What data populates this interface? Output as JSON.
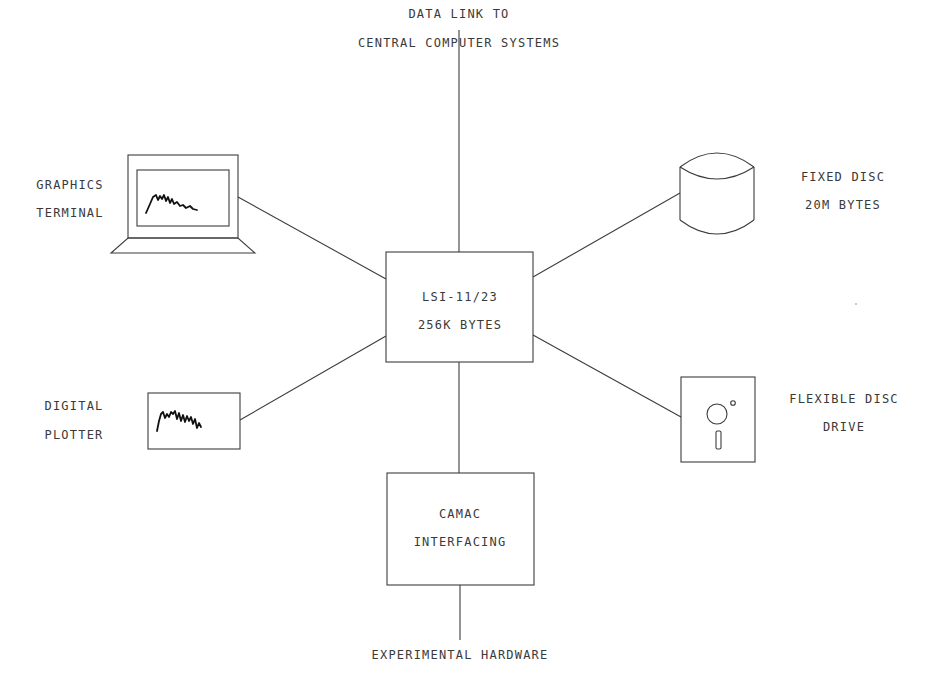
{
  "diagram": {
    "type": "system-block-diagram",
    "center": {
      "line1": "LSI-11/23",
      "line2": "256K BYTES"
    },
    "top_link": {
      "line1": "DATA LINK TO",
      "line2": "CENTRAL COMPUTER SYSTEMS"
    },
    "graphics_terminal": {
      "line1": "GRAPHICS",
      "line2": "TERMINAL",
      "icon": "terminal-icon"
    },
    "fixed_disc": {
      "line1": "FIXED DISC",
      "line2": "20M BYTES",
      "icon": "disc-cylinder-icon"
    },
    "digital_plotter": {
      "line1": "DIGITAL",
      "line2": "PLOTTER",
      "icon": "plotter-icon"
    },
    "flexible_disc": {
      "line1": "FLEXIBLE DISC",
      "line2": "DRIVE",
      "icon": "floppy-disk-icon"
    },
    "camac": {
      "line1": "CAMAC",
      "line2": "INTERFACING"
    },
    "bottom_link": {
      "line1": "EXPERIMENTAL HARDWARE"
    },
    "edges": [
      {
        "from": "LSI-11/23",
        "to": "DATA LINK TO CENTRAL COMPUTER SYSTEMS"
      },
      {
        "from": "LSI-11/23",
        "to": "GRAPHICS TERMINAL"
      },
      {
        "from": "LSI-11/23",
        "to": "FIXED DISC"
      },
      {
        "from": "LSI-11/23",
        "to": "DIGITAL PLOTTER"
      },
      {
        "from": "LSI-11/23",
        "to": "FLEXIBLE DISC DRIVE"
      },
      {
        "from": "LSI-11/23",
        "to": "CAMAC INTERFACING"
      },
      {
        "from": "CAMAC INTERFACING",
        "to": "EXPERIMENTAL HARDWARE"
      }
    ]
  }
}
